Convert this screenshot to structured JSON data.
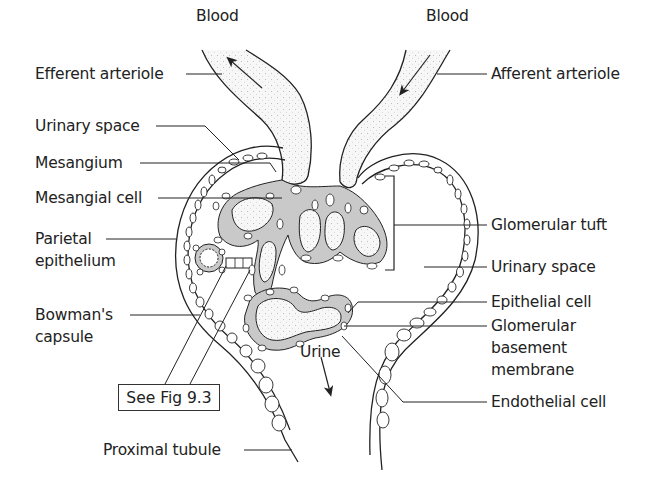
{
  "diagram": {
    "colors": {
      "line": "#222222",
      "blood_fill": "#f4f4f4",
      "mesangium_fill": "#c8c8c8",
      "background": "#ffffff"
    },
    "flow_labels": {
      "blood_left": "Blood",
      "blood_right": "Blood",
      "urine": "Urine"
    },
    "left_labels": {
      "efferent_arteriole": "Efferent arteriole",
      "urinary_space": "Urinary space",
      "mesangium": "Mesangium",
      "mesangial_cell": "Mesangial cell",
      "parietal_epithelium": "Parietal\nepithelium",
      "bowmans_capsule": "Bowman's\ncapsule",
      "proximal_tubule": "Proximal tubule"
    },
    "right_labels": {
      "afferent_arteriole": "Afferent arteriole",
      "glomerular_tuft": "Glomerular tuft",
      "urinary_space": "Urinary space",
      "epithelial_cell": "Epithelial cell",
      "glomerular_basement_membrane": "Glomerular\nbasement\nmembrane",
      "endothelial_cell": "Endothelial cell"
    },
    "reference_box": "See Fig 9.3"
  }
}
